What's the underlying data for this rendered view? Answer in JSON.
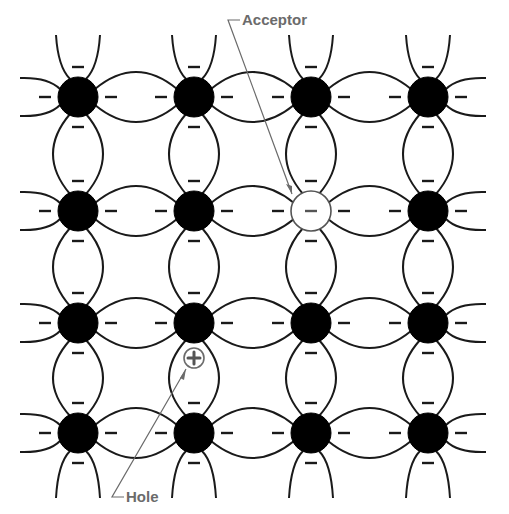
{
  "diagram": {
    "type": "p-type semiconductor crystal lattice",
    "grid": {
      "columns_x": [
        78,
        194,
        311,
        428
      ],
      "rows_y": [
        97,
        211,
        323,
        433
      ],
      "atom_radius": 20
    },
    "atoms": {
      "normal_fill": "#000000",
      "acceptor_position": {
        "col": 2,
        "row": 1
      },
      "acceptor_fill": "#ffffff"
    },
    "electron_symbol": "−",
    "hole": {
      "x": 194,
      "y": 358,
      "r": 10,
      "symbol": "+"
    },
    "labels": {
      "acceptor": "Acceptor",
      "hole": "Hole"
    },
    "colors": {
      "bond": "#1a1a1a",
      "atom": "#000000",
      "label": "#6b6b6b",
      "leader": "#6b6b6b",
      "background": "#ffffff"
    }
  }
}
